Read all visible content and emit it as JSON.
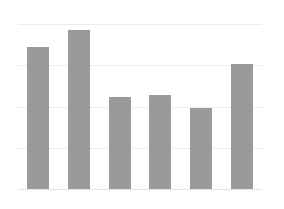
{
  "chart_data": {
    "type": "bar",
    "title": "",
    "subtitle": "",
    "xlabel": "",
    "ylabel": "",
    "categories": [
      "1",
      "2",
      "3",
      "4",
      "5",
      "6"
    ],
    "values": [
      3.44,
      3.85,
      2.24,
      2.29,
      1.97,
      3.02
    ],
    "series": [
      {
        "name": "",
        "values": [
          3.44,
          3.85,
          2.24,
          2.29,
          1.97,
          3.02
        ]
      }
    ],
    "ylim": [
      0,
      4
    ],
    "xlim": [
      0,
      6
    ],
    "gridlines_y": [
      0,
      1,
      2,
      3,
      4
    ],
    "tick_labels_y": [],
    "tick_labels_x": [],
    "grid": true,
    "grid_axis": "y",
    "legend": false,
    "legend_position": "none",
    "annotations": [],
    "bar_color": "#9a9a9a",
    "gridline_color": "#ededed",
    "background_color": "#ffffff",
    "bar_width_px": 22,
    "axes_visible": false
  },
  "figure": {
    "width": 284,
    "height": 209,
    "plot_left": 18,
    "plot_top": 24,
    "plot_width": 244,
    "plot_height": 165
  }
}
